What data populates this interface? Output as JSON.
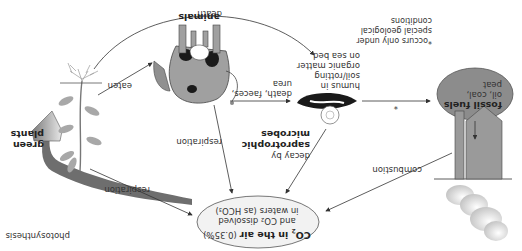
{
  "diagram": {
    "orientation": "rotated 180 degrees",
    "nodes": {
      "co2": {
        "line1_prefix": "CO",
        "line1_sub": "2",
        "line1_suffix": " in the air",
        "line1_pct": " (0.35%)",
        "line2": "and CO₂ dissolved",
        "line3": "in waters (as HCO₃)"
      },
      "plants": {
        "line1": "green",
        "line2": "plants"
      },
      "animals": {
        "label": "animals"
      },
      "humus": {
        "line1": "humus in",
        "line2": "soil/rotting",
        "line3": "organic matter",
        "line4": "on sea bed"
      },
      "fossil": {
        "line1": "fossil fuels",
        "line2": "oil, coal,",
        "line3": "peat"
      },
      "microbes": {
        "line1": "decay by",
        "line2": "saprotrophic",
        "line3": "microbes"
      }
    },
    "arrows": {
      "photosynthesis": "photosynthesis",
      "respiration_plants": "respiration",
      "respiration_animals": "respiration",
      "eaten": "eaten",
      "death_plants": "death",
      "death_animals_line1": "death, faeces,",
      "death_animals_line2": "urea",
      "asterisk": "*",
      "combustion": "combustion"
    },
    "footnote": {
      "line1": "*occurs only under",
      "line2": "special geological",
      "line3": "conditions"
    },
    "colors": {
      "ellipse_fill": "#f2f2f2",
      "fossil_fill": "#8c8c8c",
      "factory_fill": "#9a9a9a",
      "leaf_fill": "#a8a8a8",
      "arrow": "#333333",
      "cow_body": "#a0a0a0",
      "cow_spots": "#1a1a1a"
    }
  }
}
